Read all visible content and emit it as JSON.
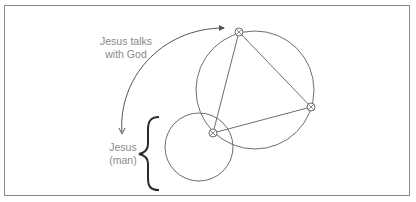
{
  "diagram": {
    "labels": {
      "talks": {
        "line1": "Jesus talks",
        "line2": "with God"
      },
      "man": {
        "line1": "Jesus",
        "line2": "(man)"
      }
    },
    "colors": {
      "stroke": "#6e6e6e",
      "text": "#8a8a8a",
      "brace": "#2a2a2a",
      "frame": "#8a8a8a"
    },
    "shapes": {
      "large_circle": {
        "cx": 255,
        "cy": 90,
        "r": 59
      },
      "small_circle": {
        "cx": 199,
        "cy": 147,
        "r": 34
      },
      "triangle_vertices": [
        [
          239,
          32
        ],
        [
          311,
          107
        ],
        [
          213,
          133
        ]
      ]
    }
  }
}
